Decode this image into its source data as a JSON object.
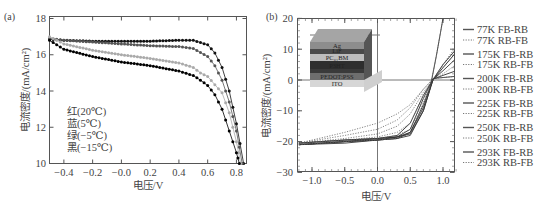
{
  "chart_data": [
    {
      "panel": "(a)",
      "type": "scatter",
      "title": "",
      "xlabel": "电压/V",
      "ylabel": "电流密度/(mA/cm²)",
      "xlim": [
        -0.5,
        0.87
      ],
      "ylim": [
        10,
        18
      ],
      "xticks": [
        "-0.4",
        "-0.2",
        "-0.0",
        "0.2",
        "0.4",
        "0.6",
        "0.8"
      ],
      "yticks": [
        "10",
        "12",
        "14",
        "16",
        "18"
      ],
      "grid": false,
      "annotation": [
        "红(20℃)",
        "蓝(5℃)",
        "绿(−5℃)",
        "黑(−15℃)"
      ],
      "series": [
        {
          "name": "红(20℃)",
          "color": "#111111",
          "x": [
            -0.5,
            -0.4,
            -0.2,
            0.0,
            0.2,
            0.4,
            0.5,
            0.6,
            0.65,
            0.7,
            0.75,
            0.8,
            0.85
          ],
          "y": [
            16.85,
            16.8,
            16.75,
            16.75,
            16.75,
            16.8,
            16.8,
            16.55,
            16.1,
            15.3,
            14.0,
            12.2,
            10.0
          ]
        },
        {
          "name": "蓝(5℃)",
          "color": "#555555",
          "x": [
            -0.5,
            -0.4,
            -0.2,
            0.0,
            0.2,
            0.4,
            0.5,
            0.6,
            0.65,
            0.7,
            0.75,
            0.8,
            0.84
          ],
          "y": [
            16.9,
            16.8,
            16.7,
            16.6,
            16.5,
            16.45,
            16.35,
            15.9,
            15.4,
            14.6,
            13.4,
            11.8,
            10.0
          ]
        },
        {
          "name": "绿(−5℃)",
          "color": "#aaaaaa",
          "x": [
            -0.5,
            -0.4,
            -0.2,
            0.0,
            0.2,
            0.4,
            0.5,
            0.55,
            0.6,
            0.7,
            0.75,
            0.8,
            0.83
          ],
          "y": [
            17.0,
            16.6,
            16.25,
            16.0,
            15.8,
            15.55,
            15.3,
            15.0,
            14.8,
            13.9,
            12.8,
            11.2,
            10.0
          ]
        },
        {
          "name": "黑(−15℃)",
          "color": "#000000",
          "x": [
            -0.5,
            -0.4,
            -0.2,
            0.0,
            0.2,
            0.4,
            0.5,
            0.55,
            0.6,
            0.65,
            0.7,
            0.75,
            0.8,
            0.82
          ],
          "y": [
            16.8,
            16.3,
            15.9,
            15.6,
            15.4,
            15.1,
            14.85,
            14.6,
            14.3,
            13.8,
            13.0,
            11.8,
            10.6,
            10.0
          ]
        }
      ]
    },
    {
      "panel": "(b)",
      "type": "line",
      "title": "",
      "xlabel": "电压/V",
      "ylabel": "电流密度/(mA/cm²)",
      "xlim": [
        -1.2,
        1.2
      ],
      "ylim": [
        -30,
        20
      ],
      "xticks": [
        "-1.0",
        "-0.5",
        "0.0",
        "0.5",
        "1.0"
      ],
      "yticks": [
        "-30",
        "-20",
        "-10",
        "0",
        "10",
        "20"
      ],
      "grid": false,
      "legend_position": "right outside",
      "inset_layers": [
        "Ag",
        "LiF",
        "PC₆₁BM",
        "P3HT",
        "PEDOT:PSS",
        "ITO"
      ],
      "series": [
        {
          "name": "77K FB-RB",
          "style": "solid",
          "x": [
            -1.2,
            -0.5,
            0.0,
            0.3,
            0.5,
            0.7,
            0.85,
            1.0,
            1.2
          ],
          "y": [
            -21,
            -20.5,
            -19.5,
            -18.5,
            -16,
            -6,
            0.5,
            0.8,
            1.2
          ]
        },
        {
          "name": "77K RB-FB",
          "style": "dotted",
          "x": [
            -1.2,
            -0.5,
            0.0,
            0.3,
            0.5,
            0.7,
            0.85,
            1.0,
            1.2
          ],
          "y": [
            -20.5,
            -17,
            -14,
            -11,
            -8,
            -3,
            0.5,
            0.8,
            1.2
          ]
        },
        {
          "name": "175K FB-RB",
          "style": "solid",
          "x": [
            -1.2,
            -0.5,
            0.0,
            0.3,
            0.5,
            0.7,
            0.85,
            1.0,
            1.2
          ],
          "y": [
            -21,
            -20,
            -19,
            -18,
            -14,
            -5,
            0.3,
            1.5,
            3
          ]
        },
        {
          "name": "175K RB-FB",
          "style": "dotted",
          "x": [
            -1.2,
            -0.5,
            0.0,
            0.3,
            0.5,
            0.7,
            0.85,
            1.0,
            1.2
          ],
          "y": [
            -20.5,
            -18,
            -16,
            -13,
            -9,
            -3,
            0.3,
            2,
            5
          ]
        },
        {
          "name": "200K FB-RB",
          "style": "solid",
          "x": [
            -1.2,
            -0.5,
            0.0,
            0.3,
            0.5,
            0.7,
            0.85,
            1.0,
            1.2
          ],
          "y": [
            -21,
            -20,
            -19.5,
            -19,
            -17,
            -8,
            0.2,
            3,
            7
          ]
        },
        {
          "name": "200K RB-FB",
          "style": "dotted",
          "x": [
            -1.2,
            -0.5,
            0.0,
            0.3,
            0.5,
            0.7,
            0.85,
            1.0,
            1.2
          ],
          "y": [
            -20.5,
            -19,
            -17.5,
            -15,
            -11,
            -4,
            0.2,
            4,
            9
          ]
        },
        {
          "name": "225K FB-RB",
          "style": "solid",
          "x": [
            -1.2,
            -0.5,
            0.0,
            0.3,
            0.5,
            0.7,
            0.85,
            1.0,
            1.2
          ],
          "y": [
            -20.5,
            -19.5,
            -19,
            -18.5,
            -17,
            -9,
            0.2,
            4,
            9
          ]
        },
        {
          "name": "225K RB-FB",
          "style": "dotted",
          "x": [
            -1.2,
            -0.5,
            0.0,
            0.3,
            0.5,
            0.7,
            0.85,
            1.0,
            1.2
          ],
          "y": [
            -20.5,
            -19.5,
            -18.5,
            -17,
            -14,
            -5,
            0.2,
            5,
            10
          ]
        },
        {
          "name": "250K FB-RB",
          "style": "solid",
          "x": [
            -1.2,
            -0.5,
            0.0,
            0.3,
            0.5,
            0.7,
            0.85,
            1.0,
            1.2
          ],
          "y": [
            -20.5,
            -19.5,
            -19,
            -18.5,
            -17.5,
            -10,
            0.2,
            5,
            10
          ]
        },
        {
          "name": "250K RB-FB",
          "style": "dotted",
          "x": [
            -1.2,
            -0.5,
            0.0,
            0.3,
            0.5,
            0.7,
            0.85,
            1.0,
            1.2
          ],
          "y": [
            -20.5,
            -19.5,
            -19,
            -18,
            -16,
            -7,
            0.2,
            5,
            11
          ]
        },
        {
          "name": "293K FB-RB",
          "style": "solid",
          "x": [
            -1.2,
            -0.5,
            0.0,
            0.3,
            0.5,
            0.7,
            0.8,
            0.9,
            1.0
          ],
          "y": [
            -21,
            -20,
            -19.5,
            -19,
            -18,
            -10,
            -3,
            8,
            20
          ]
        },
        {
          "name": "293K RB-FB",
          "style": "dotted",
          "x": [
            -1.2,
            -0.5,
            0.0,
            0.3,
            0.5,
            0.7,
            0.8,
            0.9,
            1.0
          ],
          "y": [
            -21,
            -20,
            -19.5,
            -19,
            -17.5,
            -9,
            -2.5,
            8,
            20
          ]
        }
      ]
    }
  ],
  "panel_a": {
    "label": "(a)",
    "xlabel": "电压/V",
    "ylabel": "电流密度/(mA/cm²)",
    "annotation": [
      "红(20℃)",
      "蓝(5℃)",
      "绿(−5℃)",
      "黑(−15℃)"
    ]
  },
  "panel_b": {
    "label": "(b)",
    "xlabel": "电压/V",
    "ylabel": "电流密度/(mA/cm²)",
    "inset": {
      "layers": [
        {
          "name": "Ag",
          "color": "#8d8d8d"
        },
        {
          "name": "LiF",
          "color": "#4a4a4a"
        },
        {
          "name": "PC₆₁BM",
          "color": "#bdbdbd"
        },
        {
          "name": "P3HT",
          "color": "#2e2e2e"
        },
        {
          "name": "",
          "color": "#3a3a3a"
        },
        {
          "name": "PEDOT:PSS",
          "color": "#6e6e6e"
        },
        {
          "name": "ITO",
          "color": "#d6d6d6"
        }
      ]
    },
    "legend": [
      "77K FB-RB",
      "77K RB-FB",
      "175K FB-RB",
      "175K RB-FB",
      "200K FB-RB",
      "200K RB-FB",
      "225K FB-RB",
      "225K RB-FB",
      "250K FB-RB",
      "250K RB-FB",
      "293K FB-RB",
      "293K RB-FB"
    ]
  }
}
